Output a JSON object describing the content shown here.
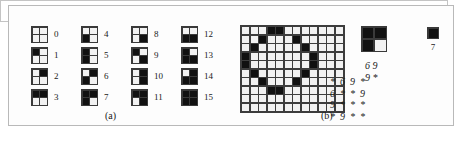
{
  "figure": {
    "panels": [
      {
        "id": "a",
        "caption": "(a)"
      },
      {
        "id": "b",
        "caption": "(b)"
      }
    ]
  },
  "panel_a": {
    "caption": "(a)",
    "description": "Sixteen 2x2 binary block patterns indexed 0 through 15",
    "columns": [
      {
        "items": [
          {
            "index": "0",
            "cells": [
              0,
              0,
              0,
              0
            ]
          },
          {
            "index": "1",
            "cells": [
              1,
              0,
              0,
              0
            ]
          },
          {
            "index": "2",
            "cells": [
              0,
              1,
              0,
              0
            ]
          },
          {
            "index": "3",
            "cells": [
              1,
              1,
              0,
              0
            ]
          }
        ]
      },
      {
        "items": [
          {
            "index": "4",
            "cells": [
              0,
              0,
              1,
              0
            ]
          },
          {
            "index": "5",
            "cells": [
              1,
              0,
              1,
              0
            ]
          },
          {
            "index": "6",
            "cells": [
              0,
              1,
              1,
              0
            ]
          },
          {
            "index": "7",
            "cells": [
              1,
              1,
              1,
              0
            ]
          }
        ]
      },
      {
        "items": [
          {
            "index": "8",
            "cells": [
              0,
              0,
              0,
              1
            ]
          },
          {
            "index": "9",
            "cells": [
              1,
              0,
              0,
              1
            ]
          },
          {
            "index": "10",
            "cells": [
              0,
              1,
              0,
              1
            ]
          },
          {
            "index": "11",
            "cells": [
              1,
              1,
              0,
              1
            ]
          }
        ]
      },
      {
        "items": [
          {
            "index": "12",
            "cells": [
              0,
              0,
              1,
              1
            ]
          },
          {
            "index": "13",
            "cells": [
              1,
              0,
              1,
              1
            ]
          },
          {
            "index": "14",
            "cells": [
              0,
              1,
              1,
              1
            ]
          },
          {
            "index": "15",
            "cells": [
              1,
              1,
              1,
              1
            ]
          }
        ]
      }
    ]
  },
  "panel_b": {
    "caption": "(b)",
    "bitmap": {
      "cols": 12,
      "rows": 10,
      "rows_data": [
        [
          0,
          0,
          0,
          1,
          1,
          0,
          0,
          0,
          0,
          0,
          0,
          0
        ],
        [
          0,
          0,
          1,
          0,
          0,
          0,
          1,
          0,
          0,
          0,
          0,
          0
        ],
        [
          0,
          1,
          0,
          0,
          0,
          0,
          0,
          1,
          0,
          0,
          0,
          0
        ],
        [
          1,
          0,
          0,
          0,
          0,
          0,
          0,
          0,
          1,
          0,
          0,
          0
        ],
        [
          1,
          0,
          0,
          0,
          0,
          0,
          0,
          0,
          1,
          0,
          0,
          0
        ],
        [
          0,
          1,
          0,
          0,
          0,
          0,
          0,
          1,
          0,
          0,
          0,
          0
        ],
        [
          0,
          0,
          1,
          0,
          0,
          0,
          1,
          0,
          0,
          0,
          0,
          0
        ],
        [
          0,
          0,
          0,
          1,
          1,
          0,
          0,
          0,
          0,
          0,
          0,
          0
        ],
        [
          0,
          0,
          0,
          0,
          0,
          0,
          0,
          0,
          0,
          0,
          0,
          0
        ],
        [
          0,
          0,
          0,
          0,
          0,
          0,
          0,
          0,
          0,
          0,
          0,
          0
        ]
      ]
    },
    "sample_tile": {
      "cells": [
        1,
        1,
        1,
        0
      ],
      "label": "",
      "codes": [
        "6 9",
        "9 *"
      ]
    },
    "single_tile": {
      "cells": [
        1
      ],
      "label": "7"
    },
    "code_matrix_left": {
      "rows": [
        "*  6  9  *",
        "6  *  *  9",
        "9  *  *  *",
        "*  9  *  *"
      ]
    }
  },
  "colors": {
    "ink": "#111111",
    "paper": "#f2f2f2",
    "grid_line": "#3a3a3a",
    "frame": "#b9b9b9",
    "text": "#1a1a1a"
  }
}
